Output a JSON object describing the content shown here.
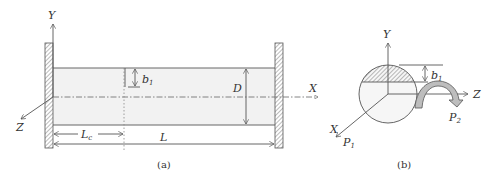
{
  "figure_a": {
    "caption": "(a)",
    "axis_y": "Y",
    "axis_x": "X",
    "axis_z": "Z",
    "label_b": "b",
    "label_b_sub": "1",
    "label_D": "D",
    "label_Lc": "L",
    "label_Lc_sub": "c",
    "label_L": "L"
  },
  "figure_b": {
    "caption": "(b)",
    "axis_y": "Y",
    "axis_x": "X",
    "axis_z": "Z",
    "label_b": "b",
    "label_b_sub": "1",
    "label_P1": "P",
    "label_P1_sub": "1",
    "label_P2": "P",
    "label_P2_sub": "2"
  },
  "colors": {
    "line": "#555555",
    "beam_fill": "#f2f2f2",
    "arrow_fill": "#bdbdbd"
  }
}
